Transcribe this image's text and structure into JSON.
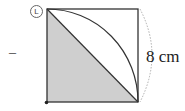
{
  "figure": {
    "tag_label": "L",
    "dash_label": "–",
    "dimension_label": "8 cm",
    "colors": {
      "shade": "#cfcfcf",
      "line": "#333333",
      "dim_arc": "#999999"
    }
  }
}
